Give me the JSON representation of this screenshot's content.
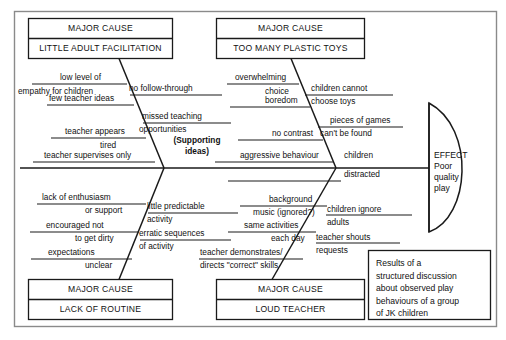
{
  "diagram": {
    "type": "fishbone-ishikawa",
    "effect": {
      "heading": "EFFECT",
      "lines": [
        "Poor",
        "quality",
        "play"
      ]
    },
    "supporting_label": [
      "(Supporting",
      "ideas)"
    ],
    "note": {
      "lines": [
        "Results of a",
        "structured discussion",
        "about observed play",
        "behaviours of a group",
        "of JK children"
      ]
    },
    "major_cause_heading": "MAJOR CAUSE",
    "categories": [
      {
        "id": "little-adult-facilitation",
        "name": "LITTLE ADULT FACILITATION",
        "position": "top-left",
        "causes_outer": [
          "low level of",
          "empathy for children",
          "few teacher ideas",
          "teacher appears",
          "tired",
          "teacher supervises only"
        ],
        "causes_inner": [
          "no follow-through",
          "missed teaching",
          "opportunities"
        ]
      },
      {
        "id": "too-many-plastic-toys",
        "name": "TOO MANY PLASTIC TOYS",
        "position": "top-right",
        "causes_outer": [
          "overwhelming",
          "choice",
          "boredom",
          "no contrast",
          "aggressive behaviour"
        ],
        "causes_inner": [
          "children cannot",
          "choose toys",
          "pieces of games",
          "can't be found",
          "children",
          "distracted"
        ]
      },
      {
        "id": "lack-of-routine",
        "name": "LACK OF ROUTINE",
        "position": "bottom-left",
        "causes_outer": [
          "lack of enthusiasm",
          "or support",
          "encouraged not",
          "to get dirty",
          "expectations",
          "unclear"
        ],
        "causes_inner": [
          "little predictable",
          "activity",
          "erratic sequences",
          "of activity"
        ]
      },
      {
        "id": "loud-teacher",
        "name": "LOUD TEACHER",
        "position": "bottom-right",
        "causes_outer": [
          "background",
          "music (ignored?)",
          "same activities",
          "each day",
          "teacher demonstrates/",
          "directs \"correct\" skills"
        ],
        "causes_inner": [
          "children ignore",
          "adults",
          "teacher shouts",
          "requests"
        ]
      }
    ]
  },
  "colors": {
    "ink": "#111111",
    "frame": "#8a8a8a",
    "paper": "#ffffff"
  }
}
